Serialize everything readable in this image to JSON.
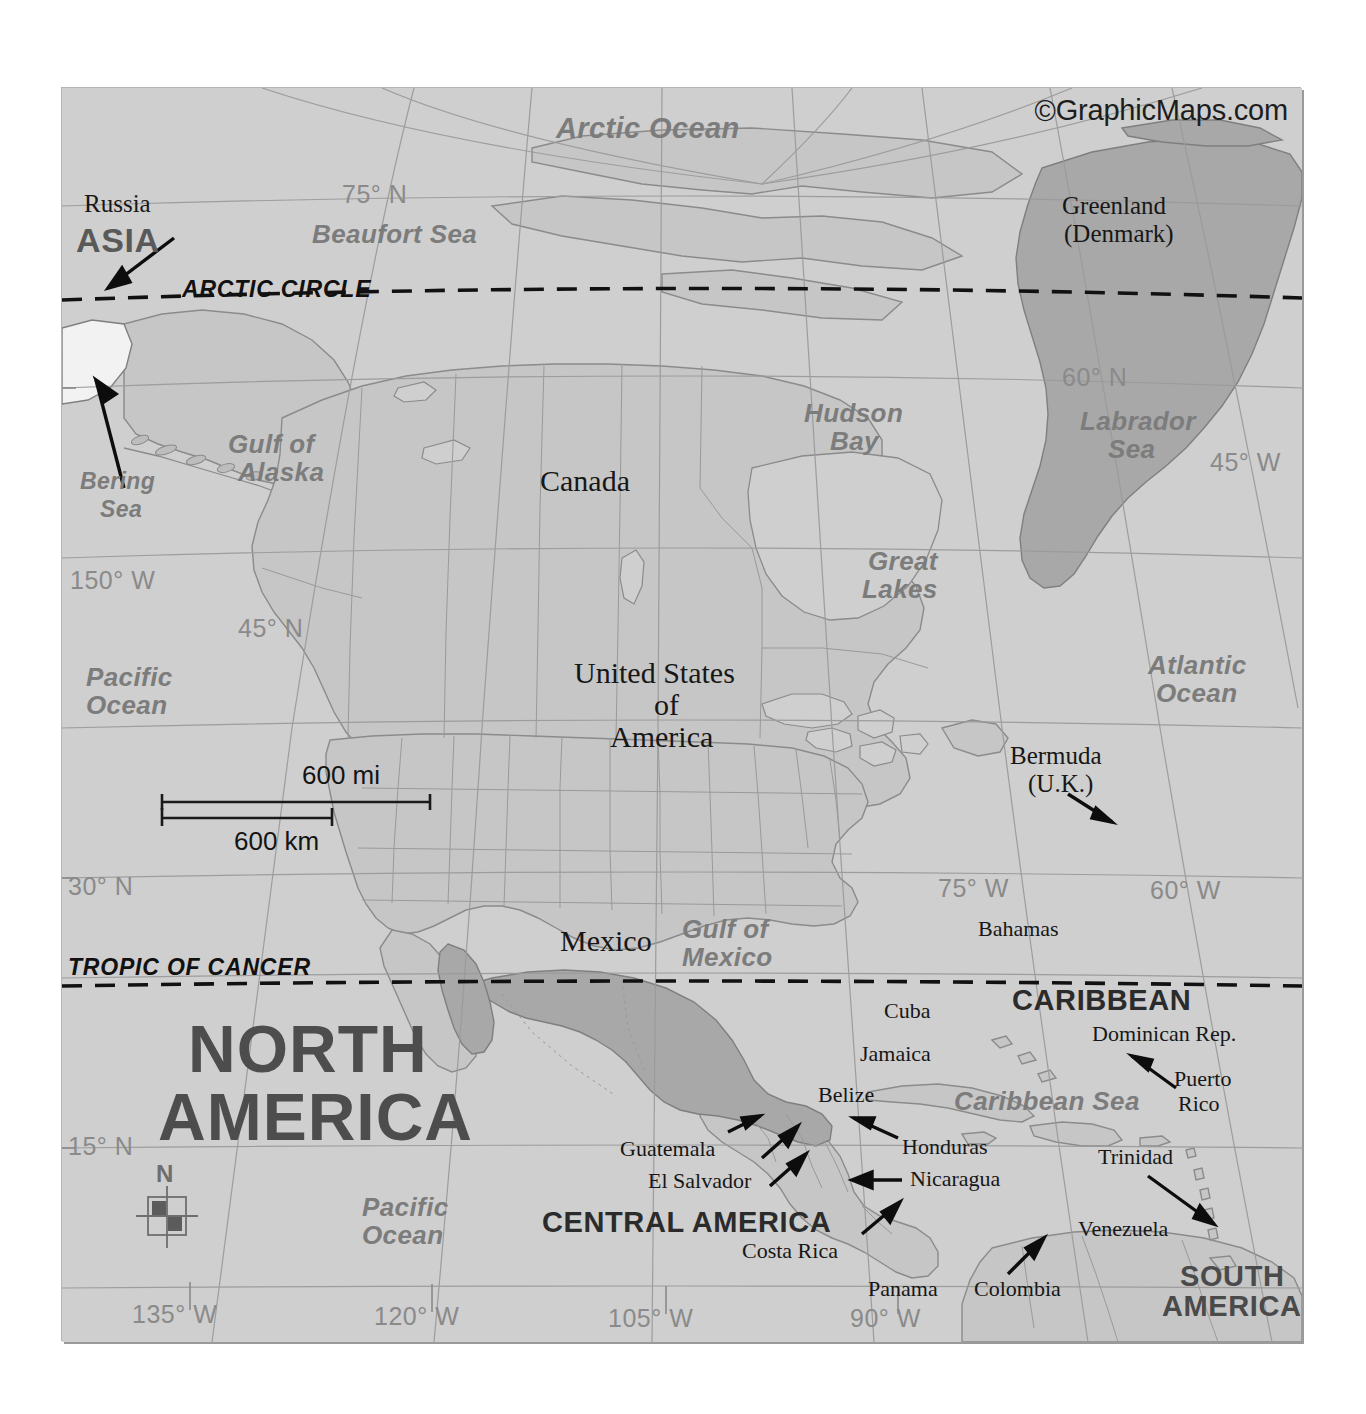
{
  "map": {
    "title": "North America Political Map",
    "copyright": {
      "mark": "©",
      "text": "GraphicMaps.com"
    },
    "background_color": "#cfcfcf",
    "land_color": "#c9c9c9",
    "highlight_color": "#a9a9a9",
    "border_color": "#8d8d8d",
    "graticule_color": "#9b9b9b"
  },
  "continents": [
    {
      "label": "NORTH\nAMERICA",
      "line1": "NORTH",
      "line2": "AMERICA"
    },
    {
      "label": "SOUTH\nAMERICA",
      "line1": "SOUTH",
      "line2": "AMERICA"
    },
    {
      "label": "ASIA"
    },
    {
      "label": "CENTRAL AMERICA"
    },
    {
      "label": "CARIBBEAN"
    }
  ],
  "countries": [
    {
      "name": "Russia"
    },
    {
      "name": "Canada"
    },
    {
      "name": "United States\nof\nAmerica",
      "l1": "United States",
      "l2": "of",
      "l3": "America"
    },
    {
      "name": "Greenland\n(Denmark)",
      "l1": "Greenland",
      "l2": "(Denmark)"
    },
    {
      "name": "Mexico"
    },
    {
      "name": "Bermuda\n(U.K.)",
      "l1": "Bermuda",
      "l2": "(U.K.)"
    },
    {
      "name": "Bahamas"
    },
    {
      "name": "Cuba"
    },
    {
      "name": "Jamaica"
    },
    {
      "name": "Belize"
    },
    {
      "name": "Dominican Rep."
    },
    {
      "name": "Puerto\nRico",
      "l1": "Puerto",
      "l2": "Rico"
    },
    {
      "name": "Guatemala"
    },
    {
      "name": "El Salvador"
    },
    {
      "name": "Honduras"
    },
    {
      "name": "Nicaragua"
    },
    {
      "name": "Costa Rica"
    },
    {
      "name": "Panama"
    },
    {
      "name": "Trinidad"
    },
    {
      "name": "Venezuela"
    },
    {
      "name": "Colombia"
    }
  ],
  "water_bodies": [
    {
      "name": "Arctic Ocean"
    },
    {
      "name": "Beaufort Sea"
    },
    {
      "name": "Bering\nSea",
      "l1": "Bering",
      "l2": "Sea"
    },
    {
      "name": "Gulf of\nAlaska",
      "l1": "Gulf of",
      "l2": "Alaska"
    },
    {
      "name": "Hudson\nBay",
      "l1": "Hudson",
      "l2": "Bay"
    },
    {
      "name": "Labrador\nSea",
      "l1": "Labrador",
      "l2": "Sea"
    },
    {
      "name": "Great\nLakes",
      "l1": "Great",
      "l2": "Lakes"
    },
    {
      "name": "Pacific\nOcean",
      "l1": "Pacific",
      "l2": "Ocean"
    },
    {
      "name": "Atlantic\nOcean",
      "l1": "Atlantic",
      "l2": "Ocean"
    },
    {
      "name": "Gulf of\nMexico",
      "l1": "Gulf of",
      "l2": "Mexico"
    },
    {
      "name": "Caribbean Sea"
    },
    {
      "name": "Pacific\nOcean",
      "l1": "Pacific",
      "l2": "Ocean"
    }
  ],
  "labels": {
    "arctic_ocean": "Arctic Ocean",
    "beaufort_sea": "Beaufort Sea",
    "bering_sea_l1": "Bering",
    "bering_sea_l2": "Sea",
    "gulf_alaska_l1": "Gulf of",
    "gulf_alaska_l2": "Alaska",
    "hudson_bay_l1": "Hudson",
    "hudson_bay_l2": "Bay",
    "labrador_sea_l1": "Labrador",
    "labrador_sea_l2": "Sea",
    "great_lakes_l1": "Great",
    "great_lakes_l2": "Lakes",
    "pacific_ocean_n_l1": "Pacific",
    "pacific_ocean_n_l2": "Ocean",
    "pacific_ocean_s_l1": "Pacific",
    "pacific_ocean_s_l2": "Ocean",
    "atlantic_ocean_l1": "Atlantic",
    "atlantic_ocean_l2": "Ocean",
    "gulf_mexico_l1": "Gulf of",
    "gulf_mexico_l2": "Mexico",
    "caribbean_sea": "Caribbean Sea",
    "russia": "Russia",
    "asia": "ASIA",
    "canada": "Canada",
    "usa_l1": "United States",
    "usa_l2": "of",
    "usa_l3": "America",
    "greenland_l1": "Greenland",
    "greenland_l2": "(Denmark)",
    "mexico": "Mexico",
    "bermuda_l1": "Bermuda",
    "bermuda_l2": "(U.K.)",
    "bahamas": "Bahamas",
    "cuba": "Cuba",
    "jamaica": "Jamaica",
    "belize": "Belize",
    "caribbean": "CARIBBEAN",
    "dominican_rep": "Dominican Rep.",
    "puerto_rico_l1": "Puerto",
    "puerto_rico_l2": "Rico",
    "guatemala": "Guatemala",
    "el_salvador": "El Salvador",
    "honduras": "Honduras",
    "nicaragua": "Nicaragua",
    "central_america": "CENTRAL AMERICA",
    "costa_rica": "Costa Rica",
    "panama": "Panama",
    "colombia": "Colombia",
    "trinidad": "Trinidad",
    "venezuela": "Venezuela",
    "south_america_l1": "SOUTH",
    "south_america_l2": "AMERICA",
    "north_america_l1": "NORTH",
    "north_america_l2": "AMERICA"
  },
  "graticule": {
    "latitudes": [
      {
        "label": "75° N"
      },
      {
        "label": "60° N"
      },
      {
        "label": "45° N"
      },
      {
        "label": "30° N"
      },
      {
        "label": "15° N"
      }
    ],
    "longitudes": [
      {
        "label": "150° W"
      },
      {
        "label": "135° W"
      },
      {
        "label": "120° W"
      },
      {
        "label": "105° W"
      },
      {
        "label": "90° W"
      },
      {
        "label": "75° W"
      },
      {
        "label": "60° W"
      },
      {
        "label": "45° W"
      }
    ],
    "lat_75": "75° N",
    "lat_60": "60° N",
    "lat_45": "45° N",
    "lat_30": "30° N",
    "lat_15": "15° N",
    "lon_150": "150° W",
    "lon_135": "135° W",
    "lon_120": "120° W",
    "lon_105": "105° W",
    "lon_90": "90° W",
    "lon_75": "75° W",
    "lon_60": "60° W",
    "lon_45": "45° W"
  },
  "reference_lines": [
    {
      "name": "ARCTIC CIRCLE",
      "style": "dashed"
    },
    {
      "name": "TROPIC OF CANCER",
      "style": "dashed"
    }
  ],
  "arctic_circle": "ARCTIC CIRCLE",
  "tropic_of_cancer": "TROPIC OF CANCER",
  "scale_bar": {
    "miles": "600 mi",
    "kilometers": "600 km"
  },
  "compass": {
    "north": "N"
  }
}
